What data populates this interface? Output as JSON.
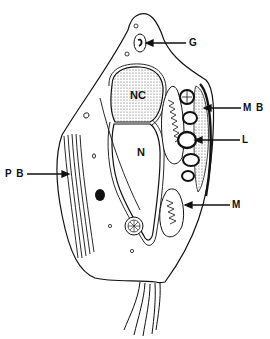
{
  "diagram": {
    "type": "cell-schematic",
    "labels": {
      "G": "G",
      "MB": "M B",
      "L": "L",
      "PB": "P B",
      "M": "M",
      "NC": "NC",
      "N": "N"
    },
    "colors": {
      "ink": "#111111",
      "background": "#ffffff",
      "stipple": "#cfcfcf"
    }
  }
}
